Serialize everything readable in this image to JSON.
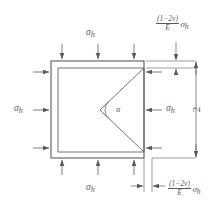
{
  "figure": {
    "background_color": "#ffffff",
    "line_color": "#5a5a5a"
  },
  "stress_labels": {
    "top": {
      "symbol": "σ",
      "subscript": "h"
    },
    "bottom": {
      "symbol": "σ",
      "subscript": "h"
    },
    "left": {
      "symbol": "σ",
      "subscript": "h"
    },
    "right": {
      "symbol": "σ",
      "subscript": "h"
    }
  },
  "angle": {
    "label": "α"
  },
  "dimensions": {
    "vertical": {
      "label": "2"
    },
    "top_right_strain": {
      "numerator": "(1−2ν)",
      "denominator": "E",
      "multiplier": "σ",
      "multiplier_subscript": "h"
    },
    "bottom_right_strain": {
      "numerator": "(1−2ν)",
      "denominator": "E",
      "multiplier": "σ",
      "multiplier_subscript": "h"
    }
  }
}
